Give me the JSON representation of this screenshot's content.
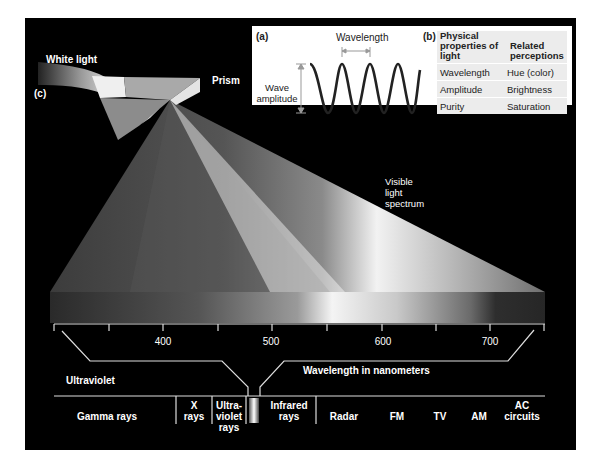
{
  "figure": {
    "panel_c_label": "(c)",
    "white_light_label": "White light",
    "prism_label": "Prism",
    "visible_spectrum_label": [
      "Visible",
      "light",
      "spectrum"
    ]
  },
  "inset_a": {
    "label": "(a)",
    "wavelength_label": "Wavelength",
    "amplitude_label": [
      "Wave",
      "amplitude"
    ]
  },
  "inset_b": {
    "label": "(b)",
    "headers": [
      "Physical properties of light",
      "Related perceptions"
    ],
    "rows": [
      {
        "physical": "Wavelength",
        "perception": "Hue (color)"
      },
      {
        "physical": "Amplitude",
        "perception": "Brightness"
      },
      {
        "physical": "Purity",
        "perception": "Saturation"
      }
    ]
  },
  "ruler": {
    "ticks": [
      "400",
      "500",
      "600",
      "700"
    ],
    "axis_label": "Wavelength in nanometers",
    "left_label": "Ultraviolet"
  },
  "em_spectrum": {
    "bands": [
      "Gamma rays",
      "X rays",
      "Ultra-violet rays",
      "Infrared rays",
      "Radar",
      "FM",
      "TV",
      "AM",
      "AC circuits"
    ]
  },
  "colors": {
    "background": "#000000",
    "inset_bg": "#ffffff",
    "table_bg": "#ececec",
    "text_light": "#ffffff"
  }
}
